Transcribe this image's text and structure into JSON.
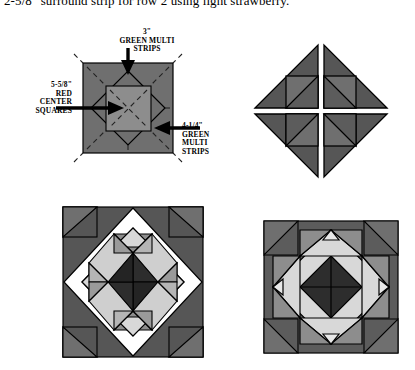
{
  "caption": {
    "top_line": "2-5/8\" surround strip for row 2 using light strawberry."
  },
  "labels": {
    "top": {
      "size": "3\"",
      "line2": "GREEN MULTI",
      "line3": "STRIPS"
    },
    "left": {
      "size": "5-5/8\"",
      "line2": "RED",
      "line3": "CENTER",
      "line4": "SQUARES"
    },
    "right": {
      "size": "4-1/4\"",
      "line2": "GREEN",
      "line3": "MULTI",
      "line4": "STRIPS"
    }
  },
  "colors": {
    "dark": "#2d2d2d",
    "mid_dark": "#565656",
    "mid": "#6f6f6f",
    "mid_light": "#8d8d8d",
    "light": "#b9b9b9",
    "pale": "#d8d8d8",
    "white": "#ffffff",
    "outline": "#000000",
    "background": "#ffffff"
  },
  "blocks": [
    {
      "name": "annotated-construction-block",
      "title": "Annotated construction block",
      "position": {
        "x": 83,
        "y": 63,
        "size": 90
      },
      "parts": [
        {
          "part": "outer-square",
          "fill": "mid"
        },
        {
          "part": "inner-diamond",
          "fill": "mid"
        },
        {
          "part": "center-square",
          "fill": "mid_light"
        }
      ],
      "stitch_guides": "dashed"
    },
    {
      "name": "pinwheel-block",
      "title": "Pinwheel half-square-triangle block",
      "position": {
        "x": 256,
        "y": 45,
        "size": 130
      },
      "quadrants": 4,
      "fill": "mid"
    },
    {
      "name": "star-block-framed",
      "title": "Star block with diagonal frame",
      "position": {
        "x": 63,
        "y": 207,
        "size": 140
      },
      "fill_center": "dark",
      "fill_frame": "white"
    },
    {
      "name": "star-block-plain",
      "title": "Star block on solid ground",
      "position": {
        "x": 264,
        "y": 221,
        "size": 133
      },
      "fill_center": "dark",
      "fill_ground": "mid"
    }
  ],
  "arrows": [
    {
      "name": "arrow-top",
      "points_to": "inner-diamond-top"
    },
    {
      "name": "arrow-left",
      "points_to": "center-square"
    },
    {
      "name": "arrow-right",
      "points_to": "inner-diamond-right"
    }
  ]
}
